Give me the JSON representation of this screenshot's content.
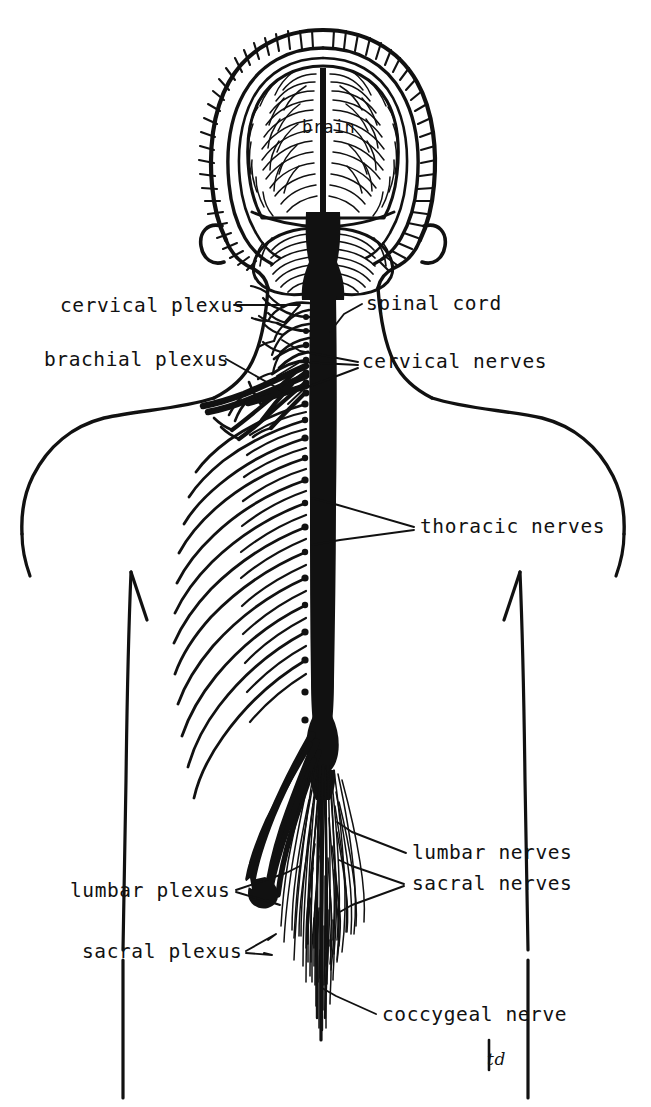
{
  "figure": {
    "ink_color": "#111111",
    "background_color": "#ffffff",
    "signature": "td"
  },
  "labels": {
    "brain": "brain",
    "cervical_plexus": "cervical plexus",
    "brachial_plexus": "brachial plexus",
    "spinal_cord": "spinal cord",
    "cervical_nerves": "cervical nerves",
    "thoracic_nerves": "thoracic nerves",
    "lumbar_nerves": "lumbar nerves",
    "sacral_nerves": "sacral nerves",
    "lumbar_plexus": "lumbar plexus",
    "sacral_plexus": "sacral plexus",
    "coccygeal_nerve": "coccygeal nerve"
  },
  "label_positions": {
    "brain": {
      "x": 302,
      "y": 133,
      "anchor": "start"
    },
    "cervical_plexus": {
      "x": 60,
      "y": 312,
      "anchor": "start"
    },
    "brachial_plexus": {
      "x": 44,
      "y": 366,
      "anchor": "start"
    },
    "spinal_cord": {
      "x": 366,
      "y": 310,
      "anchor": "start"
    },
    "cervical_nerves": {
      "x": 362,
      "y": 368,
      "anchor": "start"
    },
    "thoracic_nerves": {
      "x": 420,
      "y": 533,
      "anchor": "start"
    },
    "lumbar_nerves": {
      "x": 412,
      "y": 859,
      "anchor": "start"
    },
    "sacral_nerves": {
      "x": 412,
      "y": 890,
      "anchor": "start"
    },
    "lumbar_plexus": {
      "x": 70,
      "y": 897,
      "anchor": "start"
    },
    "sacral_plexus": {
      "x": 82,
      "y": 958,
      "anchor": "start"
    },
    "coccygeal_nerve": {
      "x": 382,
      "y": 1021,
      "anchor": "start"
    },
    "signature": {
      "x": 487,
      "y": 1065,
      "anchor": "start"
    }
  },
  "anatomy": {
    "regions": [
      {
        "name": "brain",
        "note": "coronal section: cerebrum with gyri, cerebellum, brainstem inside hatched skull"
      },
      {
        "name": "spinal-cord",
        "note": "solid black column running from brainstem to conus medullaris"
      },
      {
        "name": "cervical-nerves",
        "note": "branching nerve network, neck level"
      },
      {
        "name": "cervical-plexus",
        "note": "upper neck nerve plexus"
      },
      {
        "name": "brachial-plexus",
        "note": "thick cords radiating to shoulder/arm"
      },
      {
        "name": "thoracic-nerves",
        "note": "22 paired intercostal nerves curving down and laterally with dorsal root ganglia"
      },
      {
        "name": "lumbar-plexus",
        "note": "thick descending cords from conus"
      },
      {
        "name": "sacral-plexus",
        "note": "thick cord terminating in bulb"
      },
      {
        "name": "cauda-equina",
        "note": "fine brush of lumbar, sacral and coccygeal nerve roots"
      },
      {
        "name": "coccygeal-nerve",
        "note": "single filament at the tip of the cauda equina"
      }
    ],
    "counts": {
      "thoracic_nerve_pairs": 12,
      "ganglion_dots": 14
    }
  }
}
